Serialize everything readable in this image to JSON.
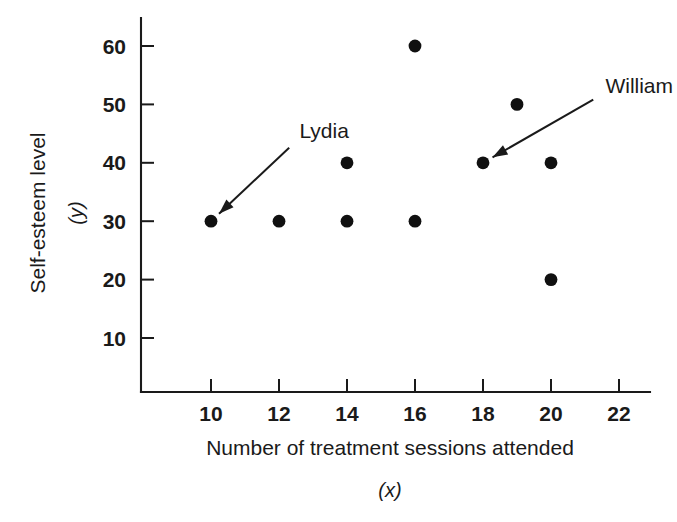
{
  "figure": {
    "width": 677,
    "height": 522,
    "background": "#ffffff",
    "ink_color": "#1a1a1a",
    "marker_color": "#101010"
  },
  "chart_data": {
    "type": "scatter",
    "title": "",
    "xlabel": "Number of treatment sessions attended",
    "xlabel_variable": "(x)",
    "ylabel": "Self-esteem level",
    "ylabel_variable": "(y)",
    "xlim": [
      8.5,
      23.2
    ],
    "ylim": [
      0,
      65
    ],
    "xticks": [
      10,
      12,
      14,
      16,
      18,
      20,
      22
    ],
    "xtick_labels": [
      "10",
      "12",
      "14",
      "16",
      "18",
      "20",
      "22"
    ],
    "yticks": [
      10,
      20,
      30,
      40,
      50,
      60
    ],
    "ytick_labels": [
      "10",
      "20",
      "30",
      "40",
      "50",
      "60"
    ],
    "grid": false,
    "legend": false,
    "points": [
      {
        "x": 10,
        "y": 30,
        "label": "Lydia"
      },
      {
        "x": 12,
        "y": 30,
        "label": ""
      },
      {
        "x": 14,
        "y": 30,
        "label": ""
      },
      {
        "x": 16,
        "y": 30,
        "label": ""
      },
      {
        "x": 14,
        "y": 40,
        "label": ""
      },
      {
        "x": 16,
        "y": 60,
        "label": ""
      },
      {
        "x": 18,
        "y": 40,
        "label": "William"
      },
      {
        "x": 19,
        "y": 50,
        "label": ""
      },
      {
        "x": 20,
        "y": 40,
        "label": ""
      },
      {
        "x": 20,
        "y": 20,
        "label": ""
      }
    ],
    "annotations": [
      {
        "text": "Lydia",
        "text_x": 12.6,
        "text_y": 44.2,
        "target_x": 10,
        "target_y": 30,
        "anchor": "start"
      },
      {
        "text": "William",
        "text_x": 21.6,
        "text_y": 52.0,
        "target_x": 18,
        "target_y": 40,
        "anchor": "start"
      }
    ]
  }
}
